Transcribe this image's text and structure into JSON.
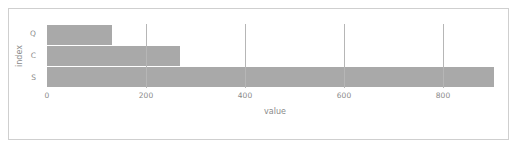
{
  "chart_data": {
    "type": "bar",
    "orientation": "horizontal",
    "title": "",
    "xlabel": "value",
    "ylabel": "index",
    "categories": [
      "Q",
      "C",
      "S"
    ],
    "values": [
      131,
      269,
      903
    ],
    "series": [
      {
        "name": "value",
        "values": [
          131,
          269,
          903
        ]
      }
    ],
    "xlim": [
      0,
      921
    ],
    "xticks": [
      0,
      200,
      400,
      600,
      800
    ],
    "xticklabels": [
      "0",
      "200",
      "400",
      "600",
      "800"
    ],
    "yticklabels": [
      "Q",
      "C",
      "S"
    ],
    "grid": "vertical",
    "legend": "none",
    "bar_color": "#a9a9a9",
    "grid_color": "#b6b6b6",
    "tick_label_color": "#8a8a8a",
    "background_color": "#ffffff",
    "frame_color": "#cfcfcf"
  }
}
